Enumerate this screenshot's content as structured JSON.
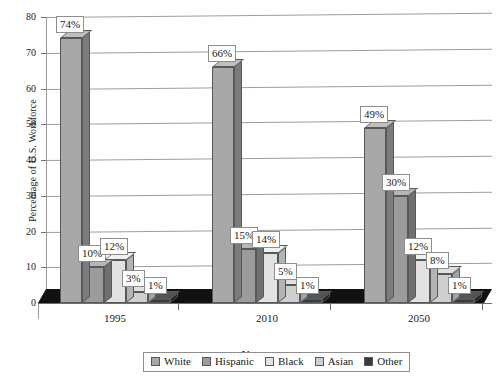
{
  "chart_data": {
    "type": "bar",
    "title": "",
    "xlabel": "Year",
    "ylabel": "Percentage of U.S. Workforce",
    "categories": [
      "1995",
      "2010",
      "2050"
    ],
    "series": [
      {
        "name": "White",
        "values": [
          74,
          66,
          49
        ],
        "color": "#a8a8a8",
        "side_color": "#7c7c7c",
        "top_color": "#c0c0c0"
      },
      {
        "name": "Hispanic",
        "values": [
          10,
          15,
          30
        ],
        "color": "#9c9c9c",
        "side_color": "#707070",
        "top_color": "#b6b6b6"
      },
      {
        "name": "Black",
        "values": [
          12,
          14,
          12
        ],
        "color": "#e2e2e2",
        "side_color": "#b4b4b4",
        "top_color": "#f0f0f0"
      },
      {
        "name": "Asian",
        "values": [
          3,
          5,
          8
        ],
        "color": "#cfcfcf",
        "side_color": "#a2a2a2",
        "top_color": "#e0e0e0"
      },
      {
        "name": "Other",
        "values": [
          1,
          1,
          1
        ],
        "color": "#3a3a3a",
        "side_color": "#1c1c1c",
        "top_color": "#555555"
      }
    ],
    "data_labels": [
      [
        "74%",
        "10%",
        "12%",
        "3%",
        "1%"
      ],
      [
        "66%",
        "15%",
        "14%",
        "5%",
        "1%"
      ],
      [
        "49%",
        "30%",
        "12%",
        "8%",
        "1%"
      ]
    ],
    "ylim": [
      0,
      80
    ],
    "yticks": [
      "0",
      "10",
      "20",
      "30",
      "40",
      "50",
      "60",
      "70",
      "80"
    ],
    "grid": true,
    "legend_position": "bottom",
    "legend_entries": [
      "White",
      "Hispanic",
      "Black",
      "Asian",
      "Other"
    ],
    "style": "3d-clustered-column"
  }
}
